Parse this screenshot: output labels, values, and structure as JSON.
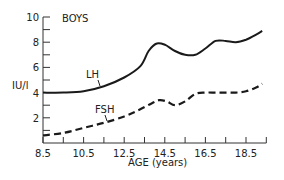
{
  "chart_data": {
    "type": "line",
    "title": "BOYS",
    "xlabel": "AGE (years)",
    "ylabel": "IU/l",
    "xlim": [
      8.5,
      19.5
    ],
    "ylim": [
      0,
      10
    ],
    "x_ticks": [
      8.5,
      9.5,
      10.5,
      11.5,
      12.5,
      13.5,
      14.5,
      15.5,
      16.5,
      17.5,
      18.5,
      19.5
    ],
    "x_tick_labels": [
      "8.5",
      "10.5",
      "12.5",
      "14.5",
      "16.5",
      "18.5"
    ],
    "y_ticks": [
      0,
      1,
      2,
      3,
      4,
      5,
      6,
      7,
      8,
      9,
      10
    ],
    "y_tick_labels": [
      "2",
      "4",
      "6",
      "8",
      "10"
    ],
    "grid": false,
    "series": [
      {
        "name": "LH",
        "style": "solid",
        "x": [
          8.5,
          9.5,
          10.5,
          11.5,
          12.5,
          13.3,
          13.7,
          14.1,
          14.5,
          15.0,
          15.5,
          16.0,
          16.5,
          17.0,
          17.5,
          18.0,
          18.5,
          19.0,
          19.3
        ],
        "y": [
          4.0,
          4.0,
          4.1,
          4.5,
          5.2,
          6.1,
          7.3,
          7.9,
          7.8,
          7.3,
          7.0,
          7.0,
          7.5,
          8.1,
          8.1,
          8.0,
          8.2,
          8.6,
          8.9
        ]
      },
      {
        "name": "FSH",
        "style": "dashed",
        "x": [
          8.5,
          9.5,
          10.5,
          11.5,
          12.5,
          13.2,
          13.8,
          14.2,
          14.6,
          15.0,
          15.5,
          16.0,
          16.5,
          17.0,
          17.5,
          18.0,
          18.5,
          19.0,
          19.3
        ],
        "y": [
          0.6,
          0.8,
          1.2,
          1.6,
          2.1,
          2.6,
          3.1,
          3.4,
          3.3,
          3.0,
          3.3,
          3.9,
          4.0,
          4.0,
          4.0,
          4.0,
          4.1,
          4.4,
          4.7
        ]
      }
    ],
    "annotations": [
      {
        "text": "LH",
        "points_to": "LH"
      },
      {
        "text": "FSH",
        "points_to": "FSH"
      }
    ]
  }
}
